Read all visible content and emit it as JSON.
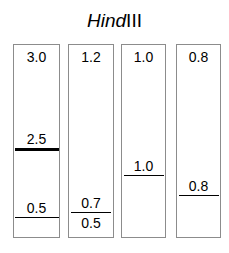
{
  "figure": {
    "type": "gel-electrophoresis-diagram",
    "title": {
      "full": "HindIII",
      "genus_part": "Hind",
      "numeral_part": "III"
    },
    "units": "kb",
    "colors": {
      "lane_border": "#8c8c8c",
      "band": "#000000",
      "background": "#ffffff",
      "text": "#000000"
    },
    "lanes": [
      {
        "name": "lane-1",
        "top_label": "3.0",
        "bands": [
          {
            "label": "2.5",
            "weight": "thick"
          },
          {
            "label": "0.5",
            "weight": "thin"
          }
        ]
      },
      {
        "name": "lane-2",
        "top_label": "1.2",
        "bands": [
          {
            "label_above": "0.7",
            "label_below": "0.5",
            "weight": "thin"
          }
        ]
      },
      {
        "name": "lane-3",
        "top_label": "1.0",
        "bands": [
          {
            "label": "1.0",
            "weight": "thin"
          }
        ]
      },
      {
        "name": "lane-4",
        "top_label": "0.8",
        "bands": [
          {
            "label": "0.8",
            "weight": "thin"
          }
        ]
      }
    ]
  }
}
